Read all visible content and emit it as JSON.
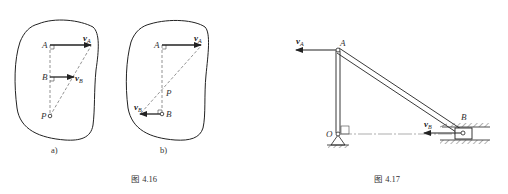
{
  "figures": [
    {
      "caption": "图 4.16",
      "panels": [
        {
          "sublabel": "a)",
          "points": {
            "A": "A",
            "B": "B",
            "P": "P"
          },
          "velocities": {
            "vA": {
              "symbol": "v",
              "subscript": "A"
            },
            "vB": {
              "symbol": "v",
              "subscript": "B"
            }
          }
        },
        {
          "sublabel": "b)",
          "points": {
            "A": "A",
            "B": "B",
            "P": "P"
          },
          "velocities": {
            "vA": {
              "symbol": "v",
              "subscript": "A"
            },
            "vB": {
              "symbol": "v",
              "subscript": "B"
            }
          }
        }
      ]
    },
    {
      "caption": "图 4.17",
      "points": {
        "A": "A",
        "B": "B",
        "O": "O"
      },
      "velocities": {
        "vA": {
          "symbol": "v",
          "subscript": "A"
        },
        "vB": {
          "symbol": "v",
          "subscript": "B"
        }
      }
    }
  ],
  "colors": {
    "line": "#222222",
    "dashed": "#777777"
  }
}
